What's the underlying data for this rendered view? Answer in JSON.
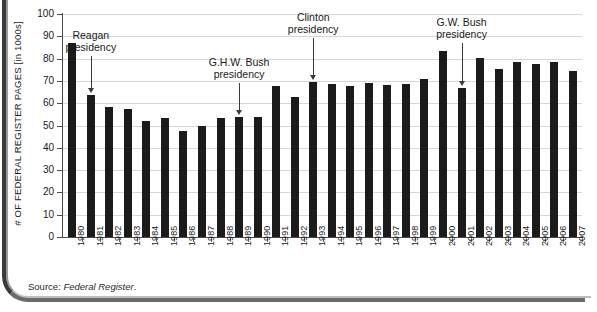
{
  "chart_data": {
    "type": "bar",
    "title": "",
    "xlabel": "",
    "ylabel": "# OF FEDERAL REGISTER PAGES [in 1000s]",
    "ylim": [
      0,
      100
    ],
    "ytick_step": 10,
    "yticks": [
      "100",
      "90",
      "80",
      "70",
      "60",
      "50",
      "40",
      "30",
      "20",
      "10",
      "0"
    ],
    "grid": true,
    "legend": "none",
    "bar_color": "#1b1b1b",
    "categories": [
      "1980",
      "1981",
      "1982",
      "1983",
      "1984",
      "1985",
      "1986",
      "1987",
      "1988",
      "1989",
      "1990",
      "1991",
      "1992",
      "1993",
      "1994",
      "1995",
      "1996",
      "1997",
      "1998",
      "1999",
      "2000",
      "2001",
      "2002",
      "2003",
      "2004",
      "2005",
      "2006",
      "2007"
    ],
    "values": [
      87,
      63.5,
      58.5,
      57.5,
      52,
      53.5,
      47.5,
      50,
      53.5,
      54,
      54,
      67.5,
      63,
      69.5,
      68.5,
      67.5,
      69,
      68,
      68.5,
      71,
      83.5,
      67,
      80.5,
      75.5,
      78.5,
      77.5,
      78.5,
      74.5
    ],
    "annotations": [
      {
        "label_line1": "Reagan",
        "label_line2": "presidency",
        "target_year": "1981"
      },
      {
        "label_line1": "G.H.W. Bush",
        "label_line2": "presidency",
        "target_year": "1989"
      },
      {
        "label_line1": "Clinton",
        "label_line2": "presidency",
        "target_year": "1993"
      },
      {
        "label_line1": "G.W. Bush",
        "label_line2": "presidency",
        "target_year": "2001"
      }
    ],
    "source_prefix": "Source: ",
    "source_italic": "Federal Register",
    "source_suffix": "."
  }
}
